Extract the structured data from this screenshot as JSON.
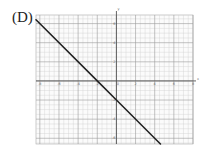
{
  "option_label": "(D)",
  "chart_data": {
    "type": "line",
    "title": "",
    "xlabel": "x",
    "ylabel": "y",
    "xlim": [
      -8.4,
      8
    ],
    "ylim": [
      -6.6,
      6.9
    ],
    "grid": true,
    "major_tick_step": 2,
    "minor_tick_step": 0.5,
    "x_ticks": [
      -8,
      -6,
      -4,
      -2,
      0,
      2,
      4,
      6,
      8
    ],
    "y_ticks": [
      -6,
      -4,
      -2,
      2,
      4,
      6
    ],
    "series": [
      {
        "name": "y = -x - 2",
        "slope": -1,
        "intercept": -2,
        "x": [
          -8.4,
          -2,
          0,
          4.6
        ],
        "y": [
          6.4,
          0,
          -2,
          -6.6
        ]
      }
    ],
    "line_color": "#222222",
    "grid_color": "#bbbbbb"
  }
}
